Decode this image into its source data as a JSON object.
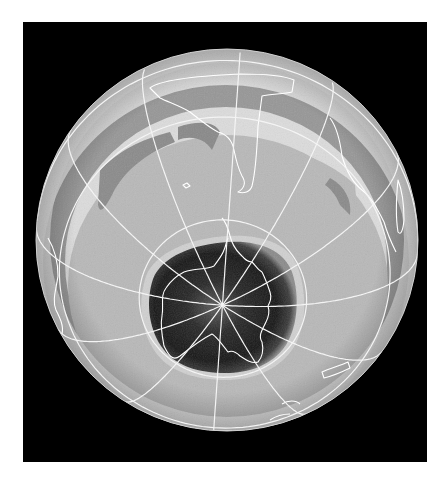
{
  "figure": {
    "projection": "oblique orthographic",
    "graticule": {
      "meridian_spacing_deg": 30,
      "latitude_circles_deg": [
        -64,
        -30,
        0
      ]
    },
    "colors": {
      "frame": "#000000",
      "page": "#ffffff",
      "gridlines": "#f4f4f4",
      "coastlines": "#ffffff",
      "ozone_high": "#e2e2e2",
      "ozone_mid": "#b9b9b9",
      "ozone_band": "#8a8a8a",
      "ozone_hole": "#1c1c1c"
    }
  }
}
